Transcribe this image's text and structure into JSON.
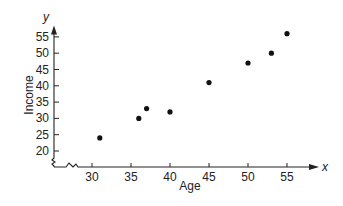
{
  "chart_data": {
    "type": "scatter",
    "title": "",
    "xlabel": "Age",
    "ylabel": "Income",
    "x_axis_variable": "x",
    "y_axis_variable": "y",
    "xticks": [
      30,
      35,
      40,
      45,
      50,
      55
    ],
    "yticks": [
      20,
      25,
      30,
      35,
      40,
      45,
      50,
      55
    ],
    "xlim": [
      27,
      58
    ],
    "ylim": [
      18,
      58
    ],
    "axis_breaks": true,
    "grid": false,
    "legend": null,
    "series": [
      {
        "name": "Income vs Age",
        "x": [
          31,
          36,
          37,
          40,
          45,
          50,
          53,
          55
        ],
        "y": [
          24,
          30,
          33,
          32,
          41,
          47,
          50,
          56
        ]
      }
    ],
    "colors": {
      "points": "#111111",
      "axes": "#222222"
    }
  }
}
